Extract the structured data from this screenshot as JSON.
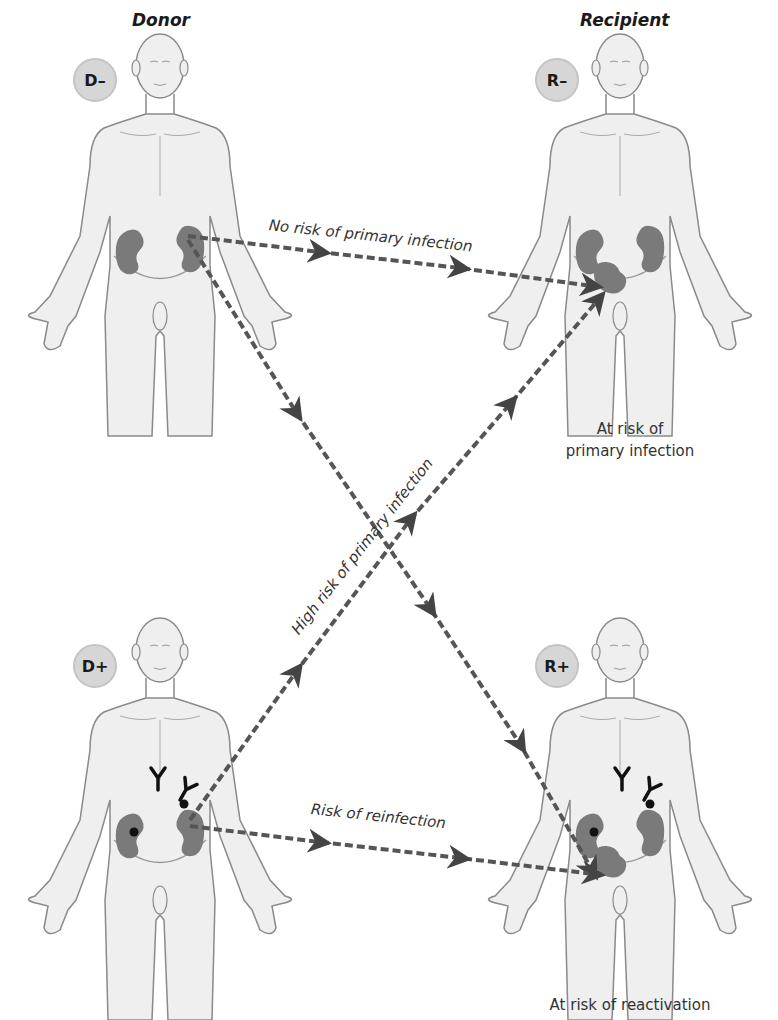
{
  "columns": {
    "donor_title": "Donor",
    "recipient_title": "Recipient"
  },
  "figures": [
    {
      "id": "donor-negative",
      "badge": "D–",
      "position": "top-left",
      "antibodies": false,
      "virus_dots": false
    },
    {
      "id": "recipient-negative",
      "badge": "R–",
      "position": "top-right",
      "antibodies": false,
      "virus_dots": false,
      "caption": "At risk of\nprimary infection"
    },
    {
      "id": "donor-positive",
      "badge": "D+",
      "position": "bottom-left",
      "antibodies": true,
      "virus_dots": true
    },
    {
      "id": "recipient-positive",
      "badge": "R+",
      "position": "bottom-right",
      "antibodies": true,
      "virus_dots": true,
      "caption": "At risk of reactivation"
    }
  ],
  "captions": {
    "recipient_negative_line1": "At risk of",
    "recipient_negative_line2": "primary infection",
    "recipient_positive": "At risk of reactivation"
  },
  "transfers": [
    {
      "from": "D–",
      "to": "R–",
      "label": "No risk of primary infection"
    },
    {
      "from": "D+",
      "to": "R–",
      "label": "High risk of primary infection"
    },
    {
      "from": "D+",
      "to": "R+",
      "label": "Risk of reinfection"
    },
    {
      "from": "D–",
      "to": "R+",
      "label": ""
    }
  ],
  "colors": {
    "body_fill": "#efefef",
    "body_stroke": "#8a8a8a",
    "kidney": "#7a7a7a",
    "arrow": "#555555",
    "badge": "#d6d6d6"
  }
}
